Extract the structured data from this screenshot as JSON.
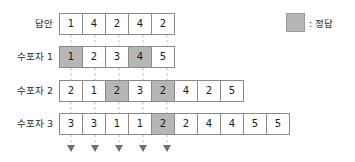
{
  "legend": {
    "swatch_color": "#b6b6b6",
    "label": ": 정답"
  },
  "grid": {
    "cell_width": 24,
    "cell_height": 22,
    "left": 59,
    "border_color": "#8a8a8a",
    "highlight_color": "#b6b6b6",
    "connector_color": "#bdbdbd"
  },
  "rows": [
    {
      "label": "답안",
      "top": 13,
      "values": [
        "1",
        "4",
        "2",
        "4",
        "2"
      ],
      "highlighted": []
    },
    {
      "label": "수포자 1",
      "top": 46,
      "values": [
        "1",
        "2",
        "3",
        "4",
        "5"
      ],
      "highlighted": [
        0,
        3
      ]
    },
    {
      "label": "수포자 2",
      "top": 80,
      "values": [
        "2",
        "1",
        "2",
        "3",
        "2",
        "4",
        "2",
        "5"
      ],
      "highlighted": [
        2,
        4
      ]
    },
    {
      "label": "수포자 3",
      "top": 113,
      "values": [
        "3",
        "3",
        "1",
        "1",
        "2",
        "2",
        "4",
        "4",
        "5",
        "5"
      ],
      "highlighted": [
        4
      ]
    }
  ],
  "connectors": {
    "count": 5,
    "arrow_y": 152,
    "columns": [
      0,
      1,
      2,
      3,
      4
    ]
  }
}
